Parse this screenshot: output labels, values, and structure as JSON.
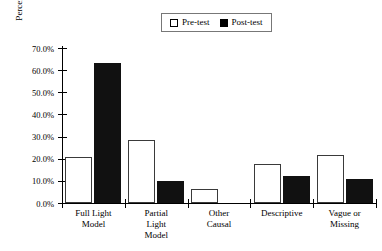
{
  "chart_data": {
    "type": "bar",
    "title": "",
    "xlabel": "",
    "ylabel": "Percentage Response",
    "ylim": [
      0,
      70
    ],
    "ytick_labels": [
      "0.0%",
      "10.0%",
      "20.0%",
      "30.0%",
      "40.0%",
      "50.0%",
      "60.0%",
      "70.0%"
    ],
    "ytick_values": [
      0,
      10,
      20,
      30,
      40,
      50,
      60,
      70
    ],
    "grid": false,
    "legend_position": "top-center",
    "categories": [
      "Full Light\nModel",
      "Partial\nLight\nModel",
      "Other\nCausal",
      "Descriptive",
      "Vague or\nMissing"
    ],
    "series": [
      {
        "name": "Pre-test",
        "swatch": "hollow",
        "color": "#ffffff",
        "edge_color": "#3a3a3a",
        "values": [
          21.0,
          28.5,
          6.2,
          17.8,
          21.8
        ]
      },
      {
        "name": "Post-test",
        "swatch": "filled",
        "color": "#111111",
        "edge_color": "#111111",
        "values": [
          63.4,
          10.0,
          0.0,
          12.1,
          10.7
        ]
      }
    ]
  },
  "legend": {
    "entries": [
      {
        "label": "Pre-test"
      },
      {
        "label": "Post-test"
      }
    ]
  }
}
